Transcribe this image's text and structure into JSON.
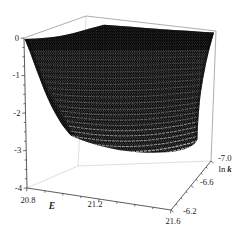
{
  "figure": {
    "background_color": "#ffffff",
    "surface_color": "#000000",
    "box_edge_color": "#8a8a8a",
    "hidden_edge_color": "#c9c9c9",
    "axis_color": "#333333"
  },
  "axes": {
    "E": {
      "title": "E",
      "tick_labels": [
        "20.8",
        "21.2",
        "21.6"
      ]
    },
    "lnk": {
      "title_prefix": "ln",
      "title_symbol": "k",
      "tick_labels": [
        "-6.2",
        "-6.6",
        "-7.0"
      ]
    },
    "z": {
      "tick_labels": [
        "0",
        "-1",
        "-2",
        "-3",
        "-4"
      ]
    }
  },
  "chart_data": {
    "type": "surface",
    "title": "",
    "xlabel": "E",
    "ylabel": "ln k",
    "zlabel": "",
    "x_range": [
      20.8,
      21.6
    ],
    "y_range": [
      -6.2,
      -7.0
    ],
    "z_range": [
      -4,
      0
    ],
    "x_ticks": [
      20.8,
      21.2,
      21.6
    ],
    "y_ticks": [
      -6.2,
      -6.6,
      -7.0
    ],
    "z_ticks": [
      0,
      -1,
      -2,
      -3,
      -4
    ],
    "x_minor_tick_step": 0.1,
    "y_minor_tick_step": 0.1,
    "z_minor_tick_step": 0.25,
    "legend": "none",
    "grid": "off",
    "surface_style": "dense black wireframe mesh; plateau at z=0 over back of domain, steep fall-off near E=20.8 at ln k=-6.2 and a broad dip to about -3 along the E=21.6 front edge",
    "E_values": [
      20.8,
      20.9,
      21.0,
      21.1,
      21.2,
      21.3,
      21.4,
      21.5,
      21.6
    ],
    "lnk_values": [
      -6.2,
      -6.3,
      -6.4,
      -6.5,
      -6.6,
      -6.7,
      -6.8,
      -6.9,
      -7.0
    ],
    "z_grid_rows_by_lnk": [
      [
        0,
        -0.4,
        -1.5,
        -2.4,
        -2.6,
        -2.6,
        -2.6,
        -2.5,
        -2.5
      ],
      [
        0,
        -0.2,
        -1.0,
        -2.0,
        -2.5,
        -2.6,
        -2.6,
        -2.6,
        -2.6
      ],
      [
        0,
        -0.1,
        -0.6,
        -1.5,
        -2.2,
        -2.5,
        -2.7,
        -2.7,
        -2.7
      ],
      [
        0,
        0,
        -0.3,
        -1.0,
        -1.8,
        -2.3,
        -2.6,
        -2.8,
        -2.8
      ],
      [
        0,
        0,
        -0.2,
        -0.6,
        -1.3,
        -2.0,
        -2.5,
        -2.8,
        -2.9
      ],
      [
        0,
        0,
        -0.1,
        -0.4,
        -0.9,
        -1.5,
        -2.1,
        -2.6,
        -2.9
      ],
      [
        0,
        0,
        0,
        -0.1,
        -0.4,
        -0.7,
        -0.9,
        -1.0,
        -1.0
      ],
      [
        0,
        0,
        0,
        0,
        -0.1,
        -0.3,
        -0.4,
        -0.4,
        -0.3
      ],
      [
        0,
        0,
        0,
        0,
        0,
        0,
        -0.1,
        -0.1,
        -0.1
      ]
    ]
  }
}
